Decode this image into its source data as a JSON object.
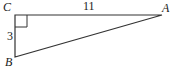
{
  "diagram": {
    "type": "right-triangle",
    "vertices": {
      "C": {
        "label": "C",
        "x": 15,
        "y": 15
      },
      "A": {
        "label": "A",
        "x": 162,
        "y": 15
      },
      "B": {
        "label": "B",
        "x": 15,
        "y": 57
      }
    },
    "sides": {
      "CA": {
        "label": "11"
      },
      "CB": {
        "label": "3"
      }
    },
    "right_angle_at": "C",
    "stroke_color": "#333333"
  }
}
